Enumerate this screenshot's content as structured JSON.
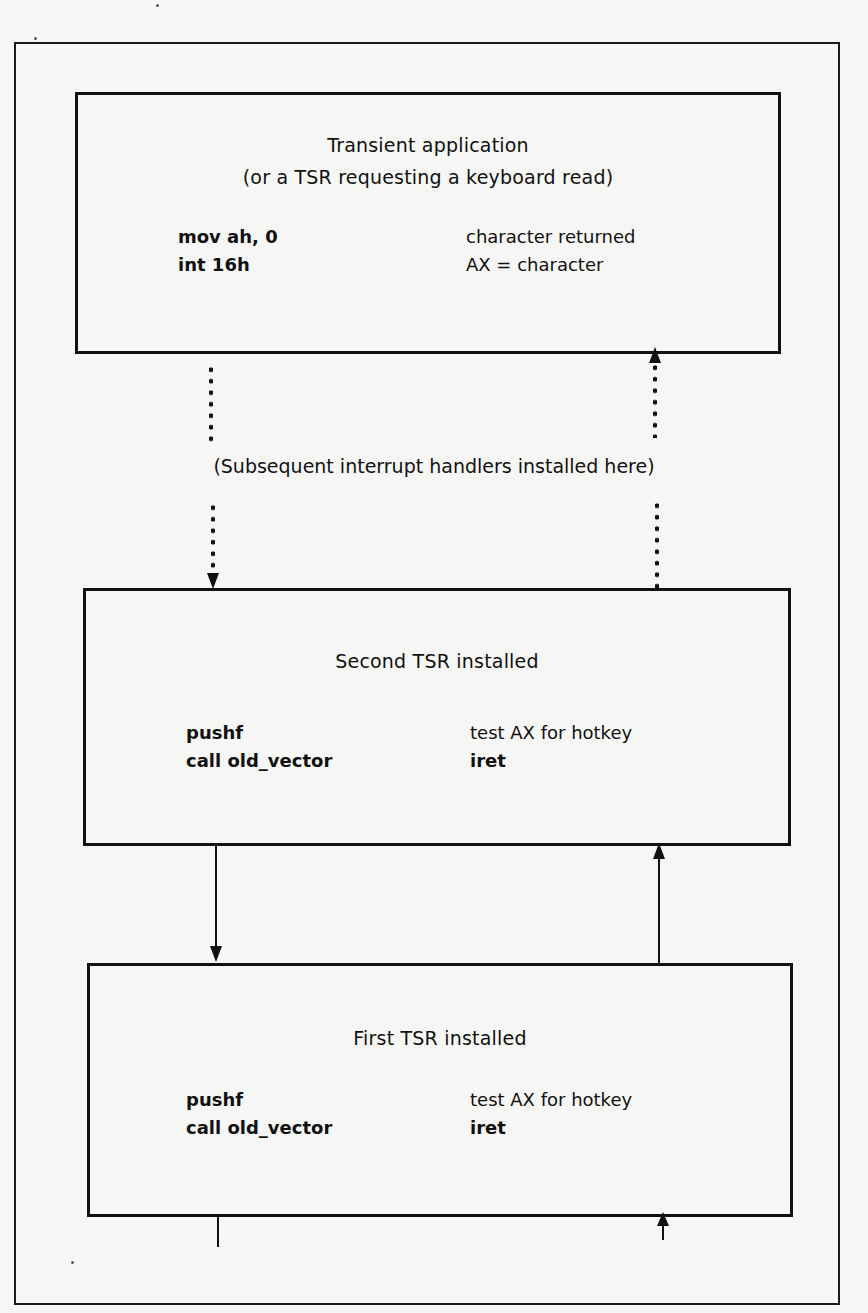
{
  "diagram": {
    "type": "interrupt-handler-chain",
    "boxes": [
      {
        "id": "transient-application",
        "title_lines": [
          "Transient application",
          "(or a TSR requesting a keyboard read)"
        ],
        "code_lines": [
          "mov ah, 0",
          "int 16h"
        ],
        "note_lines": [
          "character returned",
          "AX = character"
        ]
      },
      {
        "id": "second-tsr",
        "title_lines": [
          "Second TSR installed"
        ],
        "code_lines": [
          "pushf",
          "call old_vector"
        ],
        "note_lines": [
          "test AX for hotkey",
          "iret"
        ]
      },
      {
        "id": "first-tsr",
        "title_lines": [
          "First TSR installed"
        ],
        "code_lines": [
          "pushf",
          "call old_vector"
        ],
        "note_lines": [
          "test AX for hotkey",
          "iret"
        ]
      }
    ],
    "middle_label": "(Subsequent interrupt handlers installed here)",
    "connectors": [
      {
        "from": "transient-application",
        "to": "second-tsr",
        "side": "left",
        "style": "dotted",
        "direction": "down"
      },
      {
        "from": "second-tsr",
        "to": "transient-application",
        "side": "right",
        "style": "dotted",
        "direction": "up"
      },
      {
        "from": "second-tsr",
        "to": "first-tsr",
        "side": "left",
        "style": "solid",
        "direction": "down"
      },
      {
        "from": "first-tsr",
        "to": "second-tsr",
        "side": "right",
        "style": "solid",
        "direction": "up"
      },
      {
        "from": "first-tsr",
        "to": "below",
        "side": "left",
        "style": "solid",
        "direction": "down"
      },
      {
        "from": "below",
        "to": "first-tsr",
        "side": "right",
        "style": "solid",
        "direction": "up"
      }
    ],
    "colors": {
      "ink": "#111111",
      "paper": "#f6f6f4"
    }
  }
}
